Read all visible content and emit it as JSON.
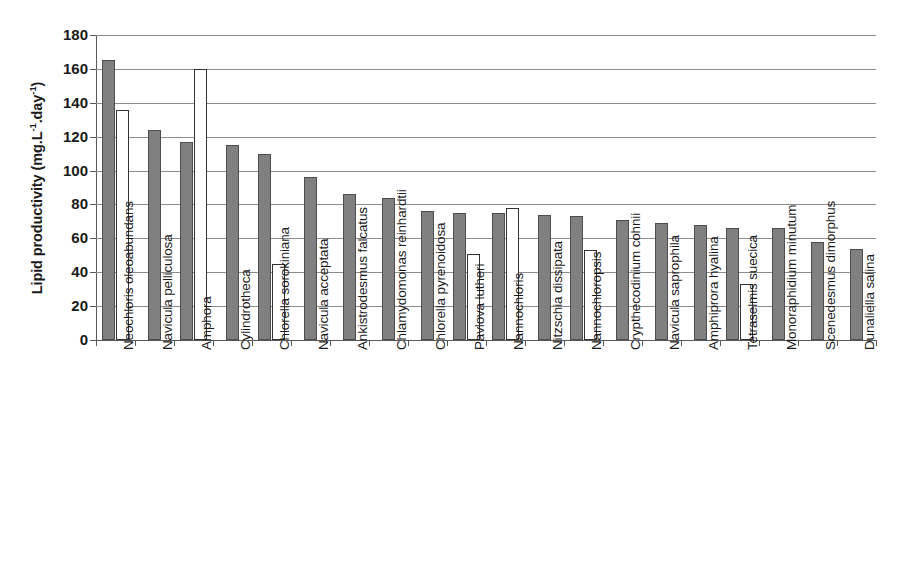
{
  "chart_data": {
    "type": "bar",
    "title": "",
    "xlabel": "",
    "ylabel": "Lipid productivity (mg.L-1.day-1)",
    "ylabel_parts": {
      "main": "Lipid productivity (mg.L",
      "sup1": "-1",
      "mid": ".day",
      "sup2": "-1",
      "tail": ")"
    },
    "ylim": [
      0,
      180
    ],
    "ytick_step": 20,
    "yticks": [
      180,
      160,
      140,
      120,
      100,
      80,
      60,
      40,
      20,
      0
    ],
    "grid": "horizontal",
    "legend": "none",
    "categories": [
      "Neochloris oleoabundans",
      "Navicula pelliculosa",
      "Amphora",
      "Cylindrotheca",
      "Chlorella sorokiniana",
      "Navicula acceptata",
      "Ankistrodesmus falcatus",
      "Chlamydomonas reinhardtii",
      "Chlorella pyrenoidosa",
      "Pavlova lutheri",
      "Nannochloris",
      "Nitzschia dissipata",
      "Nannochloropsis",
      "Crypthecodinium cohnii",
      "Navicula saprophila",
      "Amphiprora hyalina",
      "Tetraselmis suecica",
      "Monoraphidium minutum",
      "Scenedesmus dimorphus",
      "Dunaliella salina"
    ],
    "series": [
      {
        "name": "primary",
        "style": "filled-gray",
        "color": "#808080",
        "values": [
          165,
          124,
          117,
          115,
          110,
          96,
          86,
          84,
          76,
          75,
          75,
          74,
          73,
          71,
          69,
          68,
          66,
          66,
          58,
          54
        ]
      },
      {
        "name": "secondary",
        "style": "open-white",
        "color": "#ffffff",
        "values": [
          136,
          null,
          160,
          null,
          45,
          null,
          null,
          null,
          null,
          51,
          78,
          null,
          53,
          null,
          null,
          null,
          33,
          null,
          null,
          null
        ]
      }
    ]
  },
  "colors": {
    "bar_primary": "#808080",
    "bar_primary_border": "#4d4d4d",
    "bar_secondary": "#ffffff",
    "bar_secondary_border": "#333333",
    "gridline": "#8c8c8c",
    "axis": "#595959",
    "background": "#ffffff",
    "text": "#1a1a1a"
  }
}
